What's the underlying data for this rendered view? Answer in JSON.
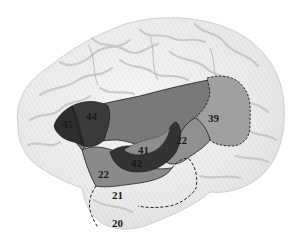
{
  "diagram": {
    "type": "lateral-brain-view",
    "colors": {
      "background": "#ffffff",
      "cortex": "#ececec",
      "cortex_shadow": "#c9c9c9",
      "region_mid": "#7a7a7a",
      "region_light": "#9a9a9a",
      "region_dark": "#3a3a3a",
      "region_darkest": "#2c2c2c",
      "boundary": "#1f1f1f"
    },
    "labels": {
      "area45": "45",
      "area44": "44",
      "area41": "41",
      "area42": "42",
      "area22_posterior": "22",
      "area22_anterior": "22",
      "area39": "39",
      "area21": "21",
      "area20": "20"
    }
  }
}
